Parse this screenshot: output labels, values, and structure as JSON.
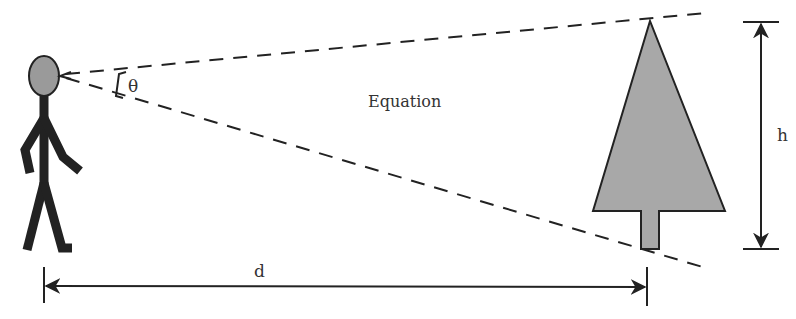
{
  "diagram": {
    "title_label": "Equation",
    "angle_label": "θ",
    "height_label": "h",
    "distance_label": "d",
    "elements": [
      "observer-stick-figure",
      "sight-lines",
      "tree",
      "height-dimension",
      "distance-dimension"
    ],
    "colors": {
      "fill_gray": "#a8a8a8",
      "stroke": "#222222",
      "background": "#ffffff"
    }
  }
}
